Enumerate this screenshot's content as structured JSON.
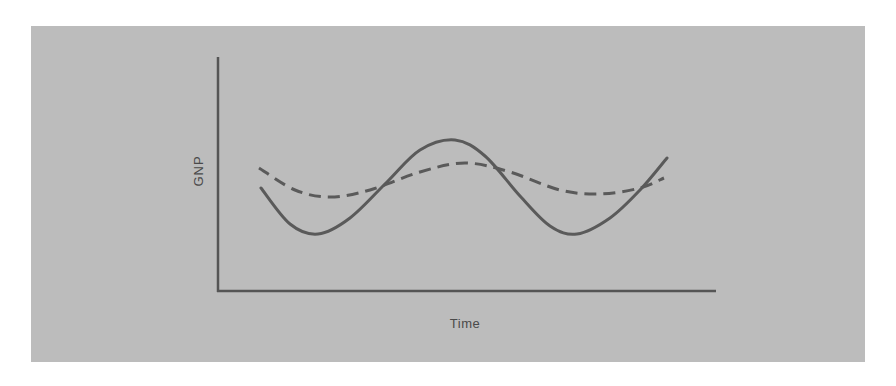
{
  "chart_data": {
    "type": "line",
    "title": "",
    "xlabel": "Time",
    "ylabel": "GNP",
    "grid": false,
    "legend": null,
    "ticks": {
      "x": [],
      "y": []
    },
    "colors": {
      "background": "#bcbcbc",
      "line": "#5a5a5a",
      "axis": "#555555",
      "text": "#4a4a4a"
    },
    "series": [
      {
        "name": "Actual GNP (fluctuating)",
        "style": "solid",
        "points_px": [
          [
            261,
            188
          ],
          [
            290,
            224
          ],
          [
            318,
            234
          ],
          [
            350,
            218
          ],
          [
            387,
            182
          ],
          [
            420,
            150
          ],
          [
            455,
            140
          ],
          [
            485,
            156
          ],
          [
            520,
            196
          ],
          [
            550,
            226
          ],
          [
            577,
            234
          ],
          [
            610,
            218
          ],
          [
            640,
            190
          ],
          [
            667,
            158
          ]
        ]
      },
      {
        "name": "Smoothed GNP",
        "style": "dashed",
        "points_px": [
          [
            259,
            168
          ],
          [
            295,
            190
          ],
          [
            330,
            197
          ],
          [
            370,
            190
          ],
          [
            420,
            172
          ],
          [
            465,
            163
          ],
          [
            510,
            172
          ],
          [
            560,
            190
          ],
          [
            600,
            194
          ],
          [
            640,
            188
          ],
          [
            664,
            178
          ]
        ]
      }
    ]
  },
  "labels": {
    "y_axis": "GNP",
    "x_axis": "Time"
  }
}
